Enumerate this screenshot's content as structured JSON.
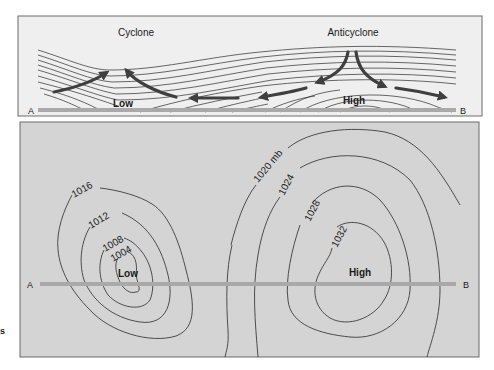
{
  "colors": {
    "top_panel_bg": "#efefef",
    "bottom_panel_bg": "#d4d4d4",
    "panel_border": "#6a6a6a",
    "section_line": "#a9a9a9",
    "isobar": "#2a2a2a",
    "arrow": "#4a4a4a",
    "text": "#1a1a1a"
  },
  "cross_section": {
    "cyclone_label": "Cyclone",
    "anticyclone_label": "Anticyclone",
    "low_label": "Low",
    "high_label": "High",
    "endpoint_a": "A",
    "endpoint_b": "B"
  },
  "map_view": {
    "low_label": "Low",
    "high_label": "High",
    "endpoint_a": "A",
    "endpoint_b": "B",
    "isobars": [
      {
        "value": "1016",
        "system": "low"
      },
      {
        "value": "1012",
        "system": "low"
      },
      {
        "value": "1008",
        "system": "low"
      },
      {
        "value": "1004",
        "system": "low"
      },
      {
        "value": "1020 mb",
        "system": "high"
      },
      {
        "value": "1024",
        "system": "high"
      },
      {
        "value": "1028",
        "system": "high"
      },
      {
        "value": "1032",
        "system": "high"
      }
    ]
  },
  "margin_fragment": "s"
}
